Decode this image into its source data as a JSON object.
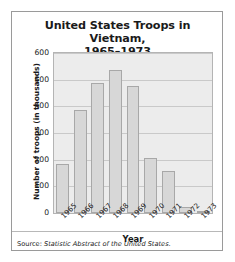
{
  "figure": {
    "title_line1": "United States Troops in Vietnam,",
    "title_line2": "1965–1973",
    "source_prefix": "Source: ",
    "source_title": "Statistic Abstract of the United States",
    "source_suffix": "."
  },
  "chart_data": {
    "type": "bar",
    "title": "United States Troops in Vietnam, 1965–1973",
    "xlabel": "Year",
    "ylabel": "Number of troops (in thousands)",
    "categories": [
      "1965",
      "1966",
      "1967",
      "1968",
      "1969",
      "1970",
      "1971",
      "1972",
      "1973"
    ],
    "values": [
      184,
      385,
      486,
      537,
      475,
      205,
      156,
      24,
      2
    ],
    "ylim": [
      0,
      600
    ],
    "yticks": [
      0,
      100,
      200,
      300,
      400,
      500,
      600
    ],
    "ytick_labels": [
      "0",
      "100",
      "200",
      "300",
      "400",
      "500",
      "600"
    ],
    "grid": "horizontal",
    "legend": "none",
    "bar_color": "#d7d7d7",
    "bar_edge_color": "#a8a8a8",
    "plot_background": "#ececec",
    "gridline_color": "#c9c9c9",
    "text_color": "#1a1a1a"
  }
}
